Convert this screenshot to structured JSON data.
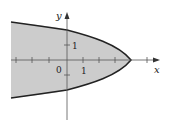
{
  "figure": {
    "x_axis_label": "x",
    "y_axis_label": "y",
    "origin_label": "0",
    "x_tick_label": "1",
    "y_tick_label": "1",
    "fill_color": "#cccccc",
    "curve_color": "#222222",
    "axis_color": "#555555"
  }
}
